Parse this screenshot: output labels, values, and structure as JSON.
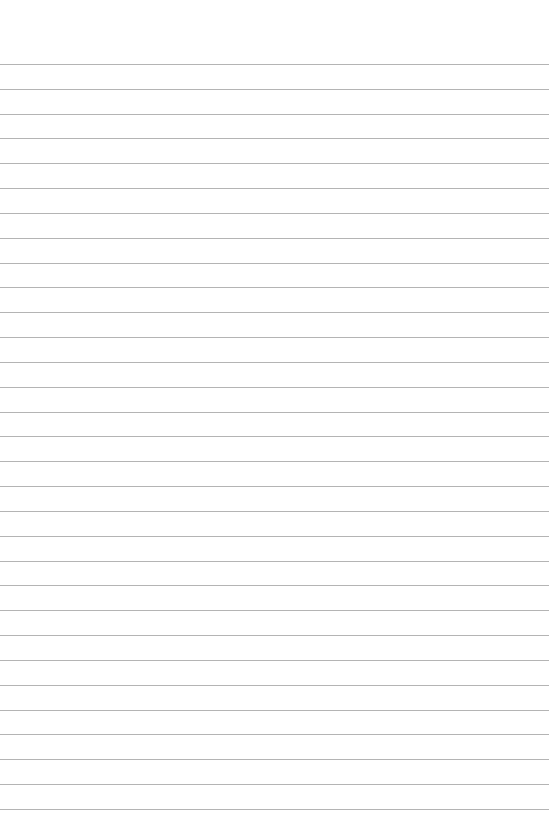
{
  "page": {
    "type": "lined-paper",
    "background_color": "#ffffff",
    "line_color": "#b4b4b4",
    "line_count": 31,
    "first_line_y": 64,
    "line_spacing": 24.83,
    "line_width": 549
  }
}
